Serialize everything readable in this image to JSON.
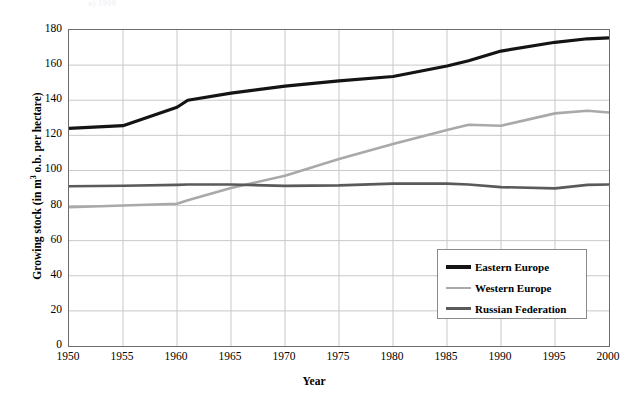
{
  "top_caption": "a) 1990",
  "chart_data": {
    "type": "line",
    "title": "",
    "xlabel": "Year",
    "ylabel": "Growing stock (in m³ o.b. per hectare)",
    "ylabel_prefix": "Growing stock (in m",
    "ylabel_sup": "3",
    "ylabel_suffix": " o.b. per hectare)",
    "xlim": [
      1950,
      2000
    ],
    "ylim": [
      0,
      180
    ],
    "ytick_step": 20,
    "xtick_step": 5,
    "grid": true,
    "legend_position": "lower right",
    "yticks": [
      "180",
      "160",
      "140",
      "120",
      "100",
      "80",
      "60",
      "40",
      "20",
      "0"
    ],
    "ytick_values": [
      180,
      160,
      140,
      120,
      100,
      80,
      60,
      40,
      20,
      0
    ],
    "xticks": [
      "1950",
      "1955",
      "1960",
      "1965",
      "1970",
      "1975",
      "1980",
      "1985",
      "1990",
      "1995",
      "2000"
    ],
    "xtick_values": [
      1950,
      1955,
      1960,
      1965,
      1970,
      1975,
      1980,
      1985,
      1990,
      1995,
      2000
    ],
    "x": [
      1950,
      1955,
      1960,
      1961,
      1965,
      1970,
      1975,
      1980,
      1985,
      1987,
      1990,
      1995,
      1998,
      2000
    ],
    "series": [
      {
        "name": "Eastern Europe",
        "color": "#141414",
        "width": 3.2,
        "values": [
          124,
          125.5,
          136,
          140,
          144,
          148,
          151,
          153.5,
          159.5,
          162.5,
          168,
          173,
          175,
          175.5
        ]
      },
      {
        "name": "Western Europe",
        "color": "#a9a9a9",
        "width": 2.6,
        "values": [
          79,
          80,
          81,
          83,
          90,
          97,
          106.5,
          115,
          123,
          126,
          125.5,
          132.5,
          134,
          133
        ]
      },
      {
        "name": "Russian Federation",
        "color": "#5a5a5a",
        "width": 2.6,
        "values": [
          91,
          91.3,
          91.8,
          92,
          92,
          91.2,
          91.5,
          92.5,
          92.5,
          92,
          90.5,
          89.8,
          91.8,
          92
        ]
      }
    ]
  },
  "legend": {
    "entries": [
      {
        "label": "Eastern Europe",
        "color": "#141414",
        "width": 4
      },
      {
        "label": "Western Europe",
        "color": "#a9a9a9",
        "width": 2.5
      },
      {
        "label": "Russian Federation",
        "color": "#5a5a5a",
        "width": 3
      }
    ]
  }
}
